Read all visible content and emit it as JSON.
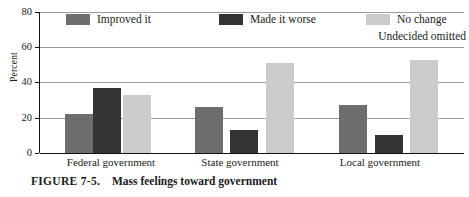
{
  "chart_data": {
    "type": "bar",
    "title": "Mass feelings toward government",
    "xlabel": "",
    "ylabel": "Percent",
    "ylim": [
      0,
      80
    ],
    "yticks": [
      0,
      20,
      40,
      60,
      80
    ],
    "grid": true,
    "legend_position": "top",
    "categories": [
      "Federal government",
      "State government",
      "Local government"
    ],
    "series": [
      {
        "name": "Improved it",
        "color": "#6e6e6e",
        "values": [
          22,
          26,
          27
        ]
      },
      {
        "name": "Made it worse",
        "color": "#333333",
        "values": [
          37,
          13,
          10
        ]
      },
      {
        "name": "No change",
        "color": "#cbcbcb",
        "values": [
          33,
          51,
          53
        ]
      }
    ],
    "annotations": [
      "Undecided omitted"
    ]
  },
  "figure": {
    "caption_label": "FIGURE 7-5.",
    "caption_text": "Mass feelings toward government"
  },
  "legend": {
    "note": "Undecided omitted"
  }
}
